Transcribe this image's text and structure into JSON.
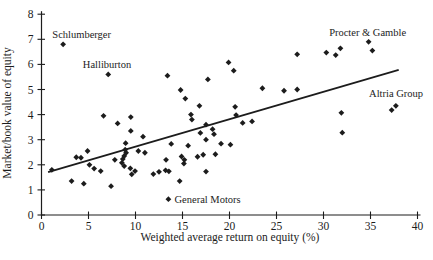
{
  "figure": {
    "background": "#ffffff",
    "ink_color": "#1c1c1c"
  },
  "chart_data": {
    "type": "scatter",
    "title": "",
    "xlabel": "Weighted average return on equity (%)",
    "ylabel": "Market/book value of equity",
    "xlim": [
      0,
      40
    ],
    "ylim": [
      0,
      8
    ],
    "xticks": [
      0,
      5,
      10,
      15,
      20,
      25,
      30,
      35,
      40
    ],
    "yticks": [
      0,
      1,
      2,
      3,
      4,
      5,
      6,
      7,
      8
    ],
    "grid": false,
    "legend": null,
    "marker": "filled-diamond",
    "marker_color": "#1c1c1c",
    "points": [
      [
        1.1,
        1.8
      ],
      [
        2.3,
        6.8
      ],
      [
        3.2,
        1.35
      ],
      [
        3.7,
        2.3
      ],
      [
        4.2,
        2.28
      ],
      [
        4.5,
        1.25
      ],
      [
        4.9,
        2.55
      ],
      [
        5.1,
        2.0
      ],
      [
        5.6,
        1.85
      ],
      [
        6.3,
        1.75
      ],
      [
        6.6,
        3.95
      ],
      [
        7.1,
        5.6
      ],
      [
        7.4,
        1.15
      ],
      [
        7.8,
        2.2
      ],
      [
        8.1,
        3.65
      ],
      [
        8.55,
        2.08
      ],
      [
        8.65,
        2.23
      ],
      [
        8.8,
        2.35
      ],
      [
        8.8,
        1.95
      ],
      [
        8.9,
        2.6
      ],
      [
        8.95,
        2.86
      ],
      [
        9.0,
        2.48
      ],
      [
        9.45,
        1.86
      ],
      [
        9.6,
        1.62
      ],
      [
        9.95,
        1.75
      ],
      [
        10.3,
        2.55
      ],
      [
        11.0,
        2.48
      ],
      [
        9.5,
        3.9
      ],
      [
        9.5,
        3.35
      ],
      [
        10.8,
        3.12
      ],
      [
        11.9,
        1.63
      ],
      [
        12.5,
        1.72
      ],
      [
        13.2,
        1.78
      ],
      [
        13.55,
        1.74
      ],
      [
        13.25,
        2.2
      ],
      [
        13.8,
        2.83
      ],
      [
        13.4,
        5.55
      ],
      [
        13.5,
        0.63
      ],
      [
        14.7,
        1.35
      ],
      [
        14.9,
        2.33
      ],
      [
        15.2,
        2.2
      ],
      [
        15.15,
        2.05
      ],
      [
        15.6,
        2.76
      ],
      [
        14.8,
        4.98
      ],
      [
        15.3,
        4.64
      ],
      [
        15.9,
        4.0
      ],
      [
        16.0,
        3.8
      ],
      [
        16.8,
        4.35
      ],
      [
        16.9,
        3.27
      ],
      [
        16.6,
        2.32
      ],
      [
        17.2,
        2.4
      ],
      [
        17.5,
        1.73
      ],
      [
        17.5,
        3.6
      ],
      [
        17.5,
        3.0
      ],
      [
        17.7,
        5.4
      ],
      [
        18.2,
        3.42
      ],
      [
        18.35,
        3.22
      ],
      [
        18.5,
        2.42
      ],
      [
        19.1,
        2.84
      ],
      [
        19.9,
        6.08
      ],
      [
        20.1,
        2.8
      ],
      [
        20.45,
        5.75
      ],
      [
        20.6,
        4.31
      ],
      [
        20.7,
        3.98
      ],
      [
        21.4,
        3.67
      ],
      [
        22.4,
        3.73
      ],
      [
        23.5,
        5.05
      ],
      [
        25.8,
        4.95
      ],
      [
        27.2,
        5.0
      ],
      [
        27.2,
        6.4
      ],
      [
        30.3,
        6.47
      ],
      [
        31.3,
        6.37
      ],
      [
        31.8,
        6.64
      ],
      [
        31.9,
        4.07
      ],
      [
        32.0,
        3.28
      ],
      [
        34.8,
        6.9
      ],
      [
        35.2,
        6.55
      ],
      [
        37.25,
        4.18
      ],
      [
        37.7,
        4.35
      ]
    ],
    "annotations": [
      {
        "text": "Schlumberger",
        "point": [
          2.3,
          6.8
        ],
        "text_pos": [
          1.15,
          7.07
        ]
      },
      {
        "text": "Halliburton",
        "point": [
          7.1,
          5.6
        ],
        "text_pos": [
          4.4,
          5.87
        ]
      },
      {
        "text": "Procter & Gamble",
        "point": [
          34.8,
          6.9
        ],
        "text_pos": [
          30.6,
          7.14
        ]
      },
      {
        "text": "Altria Group",
        "point": [
          37.5,
          4.27
        ],
        "text_pos": [
          34.85,
          4.71
        ]
      },
      {
        "text": "General Motors",
        "point": [
          13.5,
          0.63
        ],
        "text_pos": [
          14.15,
          0.49
        ]
      }
    ],
    "trend_line": {
      "x1": 0.7,
      "y1": 1.71,
      "x2": 38.0,
      "y2": 5.78
    }
  }
}
